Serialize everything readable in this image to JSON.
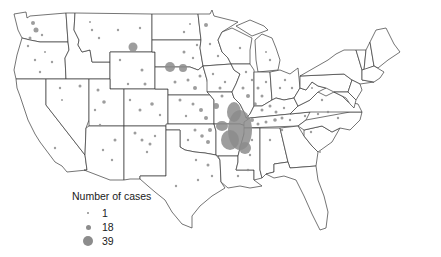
{
  "map": {
    "region": "Contiguous United States",
    "boundaries": "state borders",
    "symbol": "proportional gray circles",
    "dot_color": "#8c8c8c",
    "border_color": "#3a3a3a",
    "background": "#ffffff"
  },
  "legend": {
    "title": "Number of cases",
    "items": [
      {
        "label": "1",
        "size": 2
      },
      {
        "label": "18",
        "size": 5
      },
      {
        "label": "39",
        "size": 10
      }
    ]
  },
  "clusters": [
    {
      "area": "Missouri / Arkansas / eastern Oklahoma",
      "density": "very high"
    },
    {
      "area": "Illinois / Indiana / Kentucky / Tennessee",
      "density": "moderate"
    },
    {
      "area": "Nebraska panhandle / Wyoming",
      "density": "large individual points"
    },
    {
      "area": "Montana",
      "density": "large individual point"
    },
    {
      "area": "Western states",
      "density": "sparse"
    },
    {
      "area": "Northeast",
      "density": "very sparse"
    }
  ]
}
